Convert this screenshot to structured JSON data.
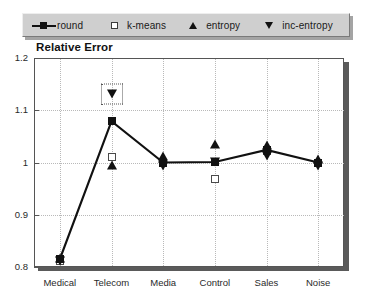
{
  "chart_data": {
    "type": "line",
    "title": "Relative Error",
    "xlabel": "",
    "ylabel": "",
    "ylim": [
      0.8,
      1.2
    ],
    "yticks": [
      "0.8",
      "0.9",
      "1",
      "1.1",
      "1.2"
    ],
    "ytick_values": [
      0.8,
      0.9,
      1.0,
      1.1,
      1.2
    ],
    "grid": "dotted",
    "legend_position": "above-plot",
    "categories": [
      "Medical",
      "Telecom",
      "Media",
      "Control",
      "Sales",
      "Noise"
    ],
    "series": [
      {
        "name": "round",
        "marker": "filled-square",
        "line": true,
        "values": [
          0.815,
          1.079,
          1.0,
          1.001,
          1.024,
          1.0
        ]
      },
      {
        "name": "k-means",
        "marker": "open-square",
        "line": false,
        "values": [
          0.812,
          1.011,
          1.0,
          0.969,
          1.022,
          1.0
        ]
      },
      {
        "name": "entropy",
        "marker": "tri-up",
        "line": false,
        "values": [
          0.818,
          0.996,
          1.013,
          1.035,
          1.034,
          1.007
        ]
      },
      {
        "name": "inc-entropy",
        "marker": "tri-down",
        "line": false,
        "values": [
          0.812,
          1.131,
          0.993,
          1.001,
          1.013,
          0.994
        ]
      }
    ],
    "annotations": [
      {
        "type": "selection-box",
        "series": "inc-entropy",
        "category": "Telecom",
        "value": 1.131
      }
    ]
  },
  "legend": {
    "items": [
      {
        "label": "round",
        "marker": "line-filled-square-marker"
      },
      {
        "label": "k-means",
        "marker": "open-square-marker"
      },
      {
        "label": "entropy",
        "marker": "triangle-up-marker"
      },
      {
        "label": "inc-entropy",
        "marker": "triangle-down-marker"
      }
    ]
  },
  "colors": {
    "series_ink": "#111111",
    "legend_panel": "#cfcfcf",
    "frame": "#555555",
    "grid": "#b9b9b9",
    "shadow": "#5a5a5a"
  }
}
